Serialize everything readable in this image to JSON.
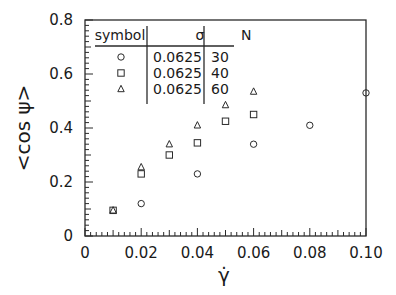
{
  "chart_data": {
    "type": "scatter",
    "title": "",
    "xlabel": "γ̇",
    "ylabel": "<cos ψ>",
    "xlim": [
      0,
      0.1
    ],
    "ylim": [
      0,
      0.8
    ],
    "x_ticks": [
      "0",
      "0.02",
      "0.04",
      "0.06",
      "0.08",
      "0.10"
    ],
    "y_ticks": [
      "0",
      "0.2",
      "0.4",
      "0.6",
      "0.8"
    ],
    "grid": false,
    "legend": {
      "position": "upper-left",
      "headers": [
        "symbol",
        "σ",
        "N"
      ],
      "rows": [
        {
          "symbol": "circle",
          "sigma": "0.0625",
          "N": "30"
        },
        {
          "symbol": "square",
          "sigma": "0.0625",
          "N": "40"
        },
        {
          "symbol": "triangle",
          "sigma": "0.0625",
          "N": "60"
        }
      ]
    },
    "series": [
      {
        "name": "N=30",
        "marker": "circle",
        "x": [
          0.02,
          0.04,
          0.06,
          0.08,
          0.1
        ],
        "y": [
          0.12,
          0.23,
          0.34,
          0.41,
          0.53
        ]
      },
      {
        "name": "N=40",
        "marker": "square",
        "x": [
          0.01,
          0.02,
          0.03,
          0.04,
          0.05,
          0.06
        ],
        "y": [
          0.095,
          0.23,
          0.3,
          0.345,
          0.425,
          0.45
        ]
      },
      {
        "name": "N=60",
        "marker": "triangle",
        "x": [
          0.01,
          0.02,
          0.03,
          0.04,
          0.05,
          0.06
        ],
        "y": [
          0.095,
          0.255,
          0.34,
          0.41,
          0.485,
          0.535
        ]
      }
    ]
  }
}
